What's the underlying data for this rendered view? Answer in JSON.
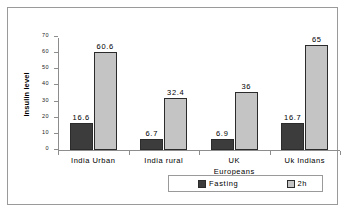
{
  "chart_data": {
    "type": "bar",
    "title": "",
    "xlabel": "",
    "ylabel": "Insulin level",
    "ylim": [
      0,
      70
    ],
    "grid": false,
    "legend_position": "bottom",
    "categories": [
      "India Urban",
      "India rural",
      "UK Europeans",
      "Uk Indians"
    ],
    "category_lines": [
      [
        "India Urban",
        ""
      ],
      [
        "India rural",
        ""
      ],
      [
        "UK",
        "Europeans"
      ],
      [
        "Uk Indians",
        ""
      ]
    ],
    "yticks": [
      0,
      10,
      20,
      30,
      40,
      50,
      60,
      70
    ],
    "ytick_labels": [
      "0",
      "10",
      "20",
      "30",
      "40",
      "50",
      "60",
      "70"
    ],
    "series": [
      {
        "name": "Fasting",
        "color": "#3c3c3c",
        "values": [
          16.6,
          6.7,
          6.9,
          16.7
        ],
        "value_labels": [
          "16.6",
          "6.7",
          "6.9",
          "16.7"
        ]
      },
      {
        "name": "2h",
        "color": "#c4c4c4",
        "values": [
          60.6,
          32.4,
          36,
          65
        ],
        "value_labels": [
          "60.6",
          "32.4",
          "36",
          "65"
        ]
      }
    ]
  },
  "legend": {
    "items": [
      {
        "label": "Fasting",
        "swatch": "fasting-swatch-icon"
      },
      {
        "label": "2h",
        "swatch": "twohour-swatch-icon"
      }
    ]
  }
}
